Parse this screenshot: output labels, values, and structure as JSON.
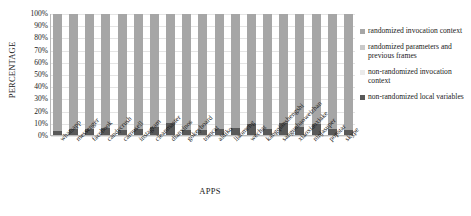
{
  "chart_data": {
    "type": "bar",
    "subtype": "stacked-bar-100-percent",
    "title": "",
    "xlabel": "APPS",
    "ylabel": "PERCENTAGE",
    "ylim": [
      0,
      100
    ],
    "ytick_labels": [
      "100%",
      "90%",
      "80%",
      "70%",
      "60%",
      "50%",
      "40%",
      "30%",
      "20%",
      "10%",
      "0%"
    ],
    "ytick_values": [
      100,
      90,
      80,
      70,
      60,
      50,
      40,
      30,
      20,
      10,
      0
    ],
    "grid": true,
    "legend_position": "right",
    "categories": [
      "whatsapp",
      "messenger",
      "facebook",
      "candycrush",
      "carousell",
      "instagram",
      "cleanmaster",
      "dianxinos",
      "gokeyboard",
      "tomcat",
      "aldiko",
      "liaomeng",
      "wechat",
      "kangqianshengshi",
      "sanguobaoweizhan",
      "xiaoxiaoxiake",
      "ninjasuper",
      "popstar",
      "skype"
    ],
    "series": [
      {
        "name": "randomized invocation context",
        "color": "#a6a6a6",
        "values": [
          97,
          95,
          95,
          94,
          96,
          95,
          93,
          90,
          96,
          96,
          95,
          94,
          91,
          95,
          90,
          93,
          91,
          95,
          96
        ]
      },
      {
        "name": "randomized parameters and previous frames",
        "color": "#c9c9c9",
        "values": [
          0,
          0,
          0,
          0,
          0,
          0,
          0,
          0,
          0,
          0,
          0,
          0,
          0,
          0,
          0,
          0,
          0,
          0,
          0
        ]
      },
      {
        "name": "non-randomized invocation context",
        "color": "#ebebeb",
        "values": [
          0,
          0,
          0,
          0,
          0,
          0,
          0,
          0,
          0,
          0,
          0,
          0,
          0,
          0,
          0,
          0,
          0,
          0,
          0
        ]
      },
      {
        "name": "non-randomized local variables",
        "color": "#595959",
        "values": [
          3,
          5,
          5,
          6,
          4,
          5,
          7,
          10,
          4,
          4,
          5,
          6,
          9,
          5,
          10,
          7,
          9,
          5,
          4
        ]
      }
    ]
  },
  "legend": {
    "items": [
      {
        "label": "randomized invocation context",
        "color": "#a6a6a6"
      },
      {
        "label": "randomized parameters and previous frames",
        "color": "#c9c9c9"
      },
      {
        "label": "non-randomized invocation context",
        "color": "#ebebeb"
      },
      {
        "label": "non-randomized local variables",
        "color": "#595959"
      }
    ]
  }
}
